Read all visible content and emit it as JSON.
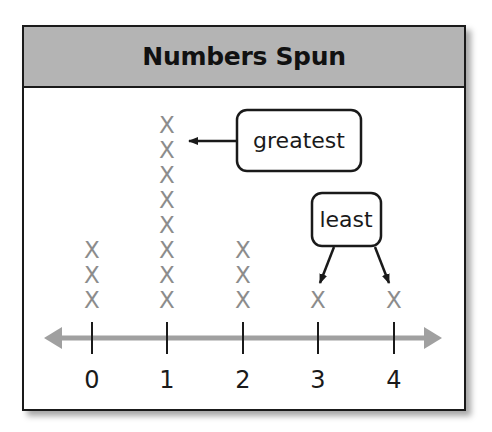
{
  "chart_data": {
    "type": "line-plot (dot plot)",
    "title": "Numbers Spun",
    "categories": [
      "0",
      "1",
      "2",
      "3",
      "4"
    ],
    "values": [
      3,
      8,
      3,
      1,
      1
    ],
    "marker": "X",
    "xlabel": "",
    "ylabel": "",
    "annotations": [
      {
        "text": "greatest",
        "points_to": [
          "1"
        ]
      },
      {
        "text": "least",
        "points_to": [
          "3",
          "4"
        ]
      }
    ],
    "colors": {
      "header": "#b4b4b4",
      "marks": "#8c8c8c",
      "axis": "#a0a0a0"
    }
  },
  "header": {
    "title": "Numbers Spun"
  },
  "axis": {
    "ticks": [
      "0",
      "1",
      "2",
      "3",
      "4"
    ]
  },
  "callouts": {
    "greatest": "greatest",
    "least": "least"
  },
  "mark_symbol": "X"
}
